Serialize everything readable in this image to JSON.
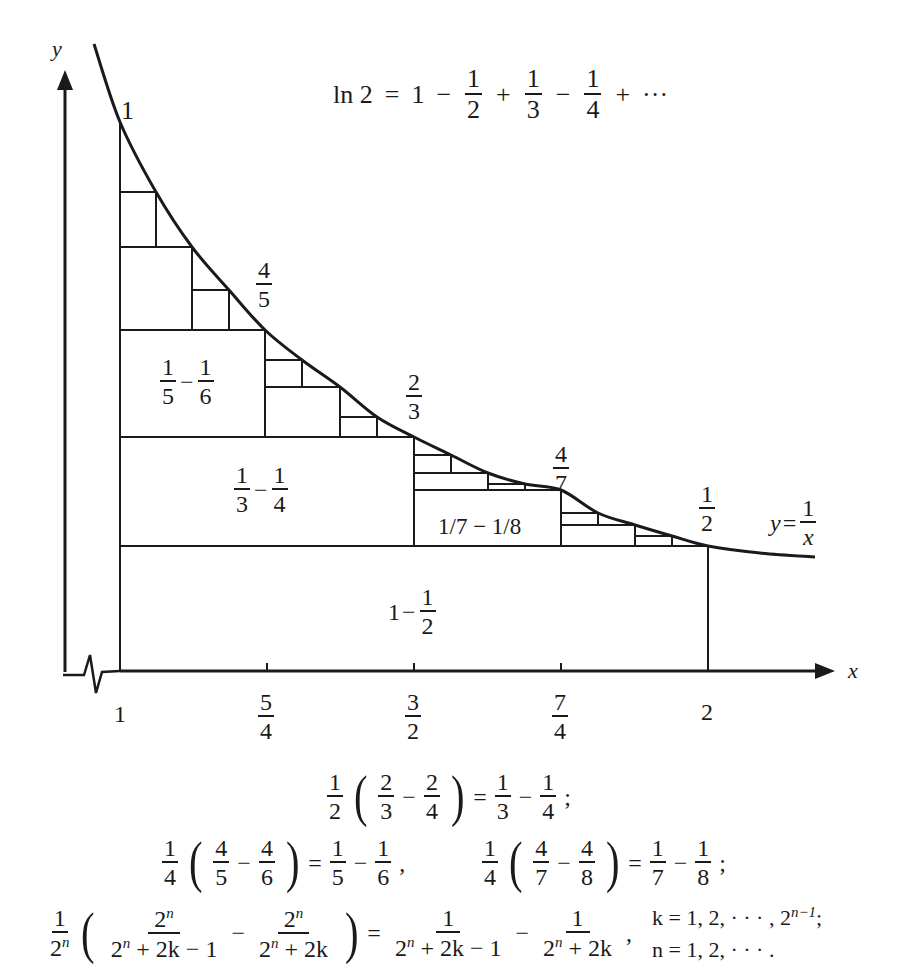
{
  "title_formula": {
    "lhs": "ln 2",
    "eq": "=",
    "terms": [
      {
        "op": "",
        "text": "1"
      },
      {
        "op": "−",
        "num": "1",
        "den": "2"
      },
      {
        "op": "+",
        "num": "1",
        "den": "3"
      },
      {
        "op": "−",
        "num": "1",
        "den": "4"
      },
      {
        "op": "+",
        "text": "···"
      }
    ]
  },
  "axes": {
    "x_label": "x",
    "y_label": "y",
    "x_ticks": [
      {
        "value": 1,
        "label": "1",
        "px": 120
      },
      {
        "value": 1.25,
        "num": "5",
        "den": "4",
        "px": 267
      },
      {
        "value": 1.5,
        "num": "3",
        "den": "2",
        "px": 414
      },
      {
        "value": 1.75,
        "num": "7",
        "den": "4",
        "px": 561
      },
      {
        "value": 2,
        "label": "2",
        "px": 708
      }
    ],
    "axis_break": "x-axis break (zigzag) near origin"
  },
  "curve": {
    "equation_label": "y = 1/x",
    "lhs": "y",
    "num": "1",
    "den": "x",
    "points_px": [
      [
        94,
        44
      ],
      [
        120,
        122
      ],
      [
        156,
        192
      ],
      [
        192,
        247
      ],
      [
        229,
        290
      ],
      [
        265,
        330
      ],
      [
        302,
        360
      ],
      [
        340,
        387
      ],
      [
        377,
        417
      ],
      [
        414,
        437
      ],
      [
        451,
        455
      ],
      [
        488,
        473
      ],
      [
        525,
        484
      ],
      [
        561,
        490
      ],
      [
        598,
        513
      ],
      [
        635,
        525
      ],
      [
        672,
        536
      ],
      [
        708,
        546
      ],
      [
        760,
        553
      ],
      [
        815,
        557
      ]
    ]
  },
  "curve_value_labels": [
    {
      "text": "1",
      "x": 120,
      "y": 122
    },
    {
      "num": "4",
      "den": "5",
      "x": 265,
      "y": 330
    },
    {
      "num": "2",
      "den": "3",
      "x": 414,
      "y": 437
    },
    {
      "num": "4",
      "den": "7",
      "x": 561,
      "y": 490
    },
    {
      "num": "1",
      "den": "2",
      "x": 708,
      "y": 546
    }
  ],
  "region_labels": [
    {
      "id": "r1",
      "parts": [
        {
          "text": "1"
        },
        {
          "text": "−"
        },
        {
          "num": "1",
          "den": "2"
        }
      ]
    },
    {
      "id": "r2",
      "parts": [
        {
          "num": "1",
          "den": "3"
        },
        {
          "text": "−"
        },
        {
          "num": "1",
          "den": "4"
        }
      ]
    },
    {
      "id": "r3",
      "parts": [
        {
          "num": "1",
          "den": "5"
        },
        {
          "text": "−"
        },
        {
          "num": "1",
          "den": "6"
        }
      ]
    },
    {
      "id": "r4",
      "text": "1/7 − 1/8"
    }
  ],
  "rectangles_px": {
    "h_lines": [
      [
        120,
        708,
        671
      ],
      [
        120,
        708,
        546
      ],
      [
        120,
        414,
        437
      ],
      [
        120,
        265,
        330
      ],
      [
        120,
        192,
        247
      ],
      [
        120,
        156,
        192
      ],
      [
        192,
        229,
        290
      ],
      [
        265,
        302,
        360
      ],
      [
        265,
        340,
        387
      ],
      [
        340,
        377,
        417
      ],
      [
        414,
        561,
        490
      ],
      [
        414,
        451,
        455
      ],
      [
        414,
        488,
        473
      ],
      [
        488,
        525,
        484
      ],
      [
        561,
        598,
        513
      ],
      [
        561,
        635,
        525
      ],
      [
        635,
        672,
        536
      ]
    ],
    "v_lines": [
      [
        120,
        122,
        671
      ],
      [
        708,
        546,
        671
      ],
      [
        414,
        437,
        546
      ],
      [
        265,
        330,
        437
      ],
      [
        156,
        192,
        247
      ],
      [
        192,
        247,
        330
      ],
      [
        229,
        290,
        330
      ],
      [
        302,
        360,
        387
      ],
      [
        340,
        387,
        437
      ],
      [
        377,
        417,
        437
      ],
      [
        561,
        490,
        546
      ],
      [
        451,
        455,
        473
      ],
      [
        488,
        473,
        490
      ],
      [
        525,
        484,
        490
      ],
      [
        598,
        513,
        525
      ],
      [
        635,
        525,
        546
      ],
      [
        672,
        536,
        546
      ]
    ]
  },
  "equations": [
    {
      "id": "eq1",
      "lhs": {
        "coef": {
          "num": "1",
          "den": "2"
        },
        "a": {
          "num": "2",
          "den": "3"
        },
        "b": {
          "num": "2",
          "den": "4"
        }
      },
      "rhs": {
        "a": {
          "num": "1",
          "den": "3"
        },
        "b": {
          "num": "1",
          "den": "4"
        }
      },
      "end": ";"
    },
    {
      "id": "eq2",
      "lhs": {
        "coef": {
          "num": "1",
          "den": "4"
        },
        "a": {
          "num": "4",
          "den": "5"
        },
        "b": {
          "num": "4",
          "den": "6"
        }
      },
      "rhs": {
        "a": {
          "num": "1",
          "den": "5"
        },
        "b": {
          "num": "1",
          "den": "6"
        }
      },
      "end": ","
    },
    {
      "id": "eq3",
      "lhs": {
        "coef": {
          "num": "1",
          "den": "4"
        },
        "a": {
          "num": "4",
          "den": "7"
        },
        "b": {
          "num": "4",
          "den": "8"
        }
      },
      "rhs": {
        "a": {
          "num": "1",
          "den": "7"
        },
        "b": {
          "num": "1",
          "den": "8"
        }
      },
      "end": ";"
    },
    {
      "id": "eq4",
      "coef_num": "1",
      "coef_den_base": "2",
      "coef_den_exp": "n",
      "a_num_base": "2",
      "a_num_exp": "n",
      "a_den": "+ 2k − 1",
      "b_num_base": "2",
      "b_num_exp": "n",
      "b_den": "+ 2k",
      "rhs_a_num": "1",
      "rhs_a_den": "+ 2k − 1",
      "rhs_b_num": "1",
      "rhs_b_den": "+ 2k",
      "cond_k": "k = 1, 2, · · · , 2",
      "cond_k_exp": "n−1",
      "cond_k_end": ";",
      "cond_n": "n = 1, 2, · · · ."
    }
  ],
  "symbols": {
    "minus": "−",
    "plus": "+",
    "equals": "=",
    "lparen": "(",
    "rparen": ")",
    "comma": ","
  },
  "colors": {
    "ink": "#1a1a1a",
    "background": "#ffffff"
  }
}
